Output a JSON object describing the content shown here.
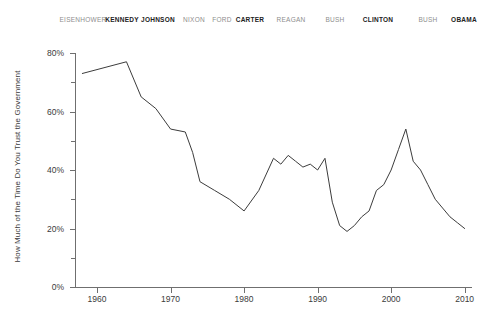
{
  "chart_data": {
    "type": "line",
    "title": "",
    "xlabel": "",
    "ylabel": "How Much of the Time Do You Trust the Government",
    "xlim": [
      1957,
      2011
    ],
    "ylim": [
      0,
      80
    ],
    "grid": false,
    "legend": "none",
    "y_tick_labels": [
      "0%",
      "20%",
      "40%",
      "60%",
      "80%"
    ],
    "y_tick_values": [
      0,
      20,
      40,
      60,
      80
    ],
    "y_minor_tick_values": [
      10,
      30,
      50,
      70
    ],
    "x_tick_labels": [
      "1960",
      "1970",
      "1980",
      "1990",
      "2000",
      "2010"
    ],
    "x_tick_values": [
      1960,
      1970,
      1980,
      1990,
      2000,
      2010
    ],
    "series": [
      {
        "name": "Trust in Government",
        "color": "#3c3c3c",
        "x": [
          1958,
          1964,
          1966,
          1968,
          1970,
          1972,
          1973,
          1974,
          1976,
          1978,
          1980,
          1982,
          1984,
          1985,
          1986,
          1987,
          1988,
          1989,
          1990,
          1991,
          1992,
          1993,
          1994,
          1995,
          1996,
          1997,
          1998,
          1999,
          2000,
          2001,
          2002,
          2003,
          2004,
          2005,
          2006,
          2007,
          2008,
          2009,
          2010
        ],
        "values": [
          73,
          77,
          65,
          61,
          54,
          53,
          46,
          36,
          33,
          30,
          26,
          33,
          44,
          42,
          45,
          43,
          41,
          42,
          40,
          44,
          29,
          21,
          19,
          21,
          24,
          26,
          33,
          35,
          40,
          47,
          54,
          43,
          40,
          35,
          30,
          27,
          24,
          22,
          20
        ]
      }
    ],
    "annotations": {
      "presidents": [
        {
          "name": "EISENHOWER",
          "emphasis": "weak",
          "x_px": 83
        },
        {
          "name": "KENNEDY",
          "emphasis": "strong",
          "x_px": 122
        },
        {
          "name": "JOHNSON",
          "emphasis": "strong",
          "x_px": 158
        },
        {
          "name": "NIXON",
          "emphasis": "weak",
          "x_px": 194
        },
        {
          "name": "FORD",
          "emphasis": "weak",
          "x_px": 222
        },
        {
          "name": "CARTER",
          "emphasis": "strong",
          "x_px": 250
        },
        {
          "name": "REAGAN",
          "emphasis": "weak",
          "x_px": 291
        },
        {
          "name": "BUSH",
          "emphasis": "weak",
          "x_px": 335
        },
        {
          "name": "CLINTON",
          "emphasis": "strong",
          "x_px": 378
        },
        {
          "name": "BUSH",
          "emphasis": "weak",
          "x_px": 428
        },
        {
          "name": "OBAMA",
          "emphasis": "strong",
          "x_px": 464
        }
      ]
    }
  }
}
